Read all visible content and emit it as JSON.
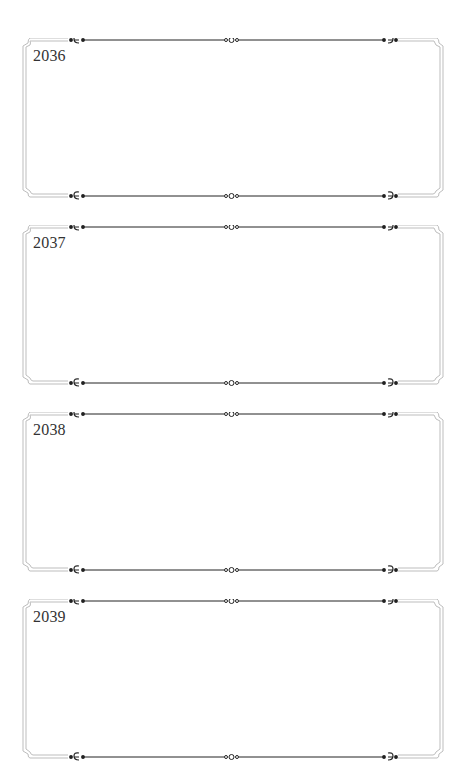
{
  "page": {
    "frames": [
      {
        "year": "2036",
        "top": 38
      },
      {
        "year": "2037",
        "top": 225
      },
      {
        "year": "2038",
        "top": 412
      },
      {
        "year": "2039",
        "top": 599
      }
    ],
    "colors": {
      "frame_line": "#b8b8b8",
      "ornament": "#222222"
    },
    "ornaments": {
      "left": "scroll-ornament-left",
      "center": "triple-ring-ornament",
      "right": "scroll-ornament-right"
    }
  }
}
